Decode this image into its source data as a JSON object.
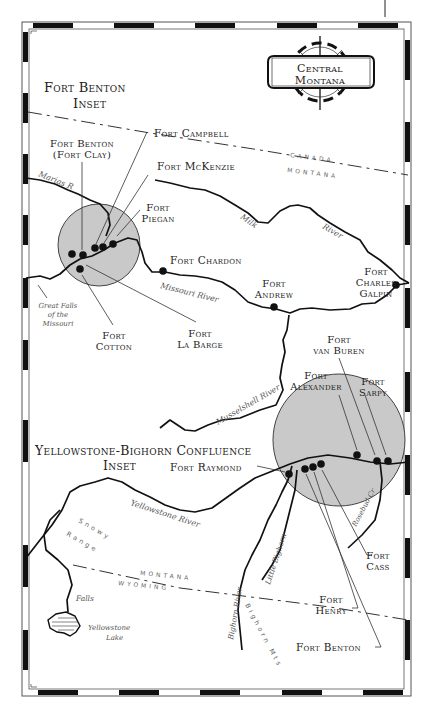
{
  "map": {
    "title_line1": "Central",
    "title_line2": "Montana",
    "insets": {
      "fort_benton": {
        "line1": "Fort Benton",
        "line2": "Inset"
      },
      "yellowstone": {
        "line1": "Yellowstone-Bighorn Confluence",
        "line2": "Inset"
      }
    },
    "forts": {
      "benton_clay_1": "Fort Benton",
      "benton_clay_2": "(Fort Clay)",
      "campbell": "Fort Campbell",
      "mckenzie": "Fort McKenzie",
      "piegan_1": "Fort",
      "piegan_2": "Piegan",
      "chardon": "Fort Chardon",
      "andrew_1": "Fort",
      "andrew_2": "Andrew",
      "charles_galpin_1": "Fort",
      "charles_galpin_2": "Charles",
      "charles_galpin_3": "Galpin",
      "cotton_1": "Fort",
      "cotton_2": "Cotton",
      "la_barge_1": "Fort",
      "la_barge_2": "La Barge",
      "van_buren_1": "Fort",
      "van_buren_2": "van Buren",
      "alexander_1": "Fort",
      "alexander_2": "Alexander",
      "sarpy_1": "Fort",
      "sarpy_2": "Sarpy",
      "raymond": "Fort Raymond",
      "cass_1": "Fort",
      "cass_2": "Cass",
      "henry_1": "Fort",
      "henry_2": "Henry",
      "benton": "Fort Benton"
    },
    "rivers": {
      "marias": "Marias R",
      "milk": "Milk",
      "milk_river": "River",
      "missouri": "Missouri River",
      "musselshell": "Musselshell River",
      "yellowstone": "Yellowstone River",
      "bighorn": "Bighorn River",
      "little_bighorn": "Little Bighorn",
      "rosebud": "Rosebud Cr",
      "great_falls_1": "Great Falls",
      "great_falls_2": "of the",
      "great_falls_3": "Missouri",
      "falls": "Falls",
      "yellowstone_lake_1": "Yellowstone",
      "yellowstone_lake_2": "Lake"
    },
    "terrain": {
      "snowy_1": "Snowy",
      "snowy_2": "Range",
      "bighorn_mts": "Bighorn Mts"
    },
    "boundaries": {
      "canada": "CANADA",
      "montana_north": "MONTANA",
      "montana_south": "MONTANA",
      "wyoming": "WYOMING"
    },
    "colors": {
      "ink": "#111111",
      "inset_fill": "#c9c9c9",
      "label": "#222222",
      "river_label": "#555555"
    }
  }
}
